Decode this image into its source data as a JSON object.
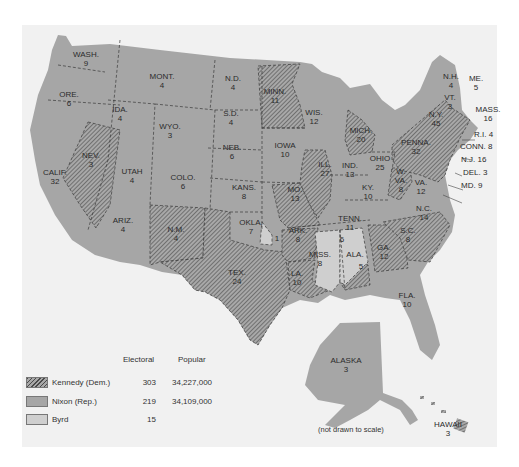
{
  "map": {
    "title": "",
    "background": "#f1f1f1",
    "colors": {
      "nixon_fill": "#a6a6a6",
      "kennedy_fill": "#a6a6a6",
      "kennedy_hatch": "#555555",
      "byrd_fill": "#cfcfcf",
      "border": "#3a3a3a"
    },
    "states": [
      {
        "abbr": "WASH.",
        "electoral": "9",
        "winner": "Nixon"
      },
      {
        "abbr": "ORE.",
        "electoral": "6",
        "winner": "Nixon"
      },
      {
        "abbr": "CALIF.",
        "electoral": "32",
        "winner": "Nixon"
      },
      {
        "abbr": "NEV.",
        "electoral": "3",
        "winner": "Kennedy"
      },
      {
        "abbr": "IDA.",
        "electoral": "4",
        "winner": "Nixon"
      },
      {
        "abbr": "MONT.",
        "electoral": "4",
        "winner": "Nixon"
      },
      {
        "abbr": "WYO.",
        "electoral": "3",
        "winner": "Nixon"
      },
      {
        "abbr": "UTAH",
        "electoral": "4",
        "winner": "Nixon"
      },
      {
        "abbr": "ARIZ.",
        "electoral": "4",
        "winner": "Nixon"
      },
      {
        "abbr": "COLO.",
        "electoral": "6",
        "winner": "Nixon"
      },
      {
        "abbr": "N.M.",
        "electoral": "4",
        "winner": "Kennedy"
      },
      {
        "abbr": "N.D.",
        "electoral": "4",
        "winner": "Nixon"
      },
      {
        "abbr": "S.D.",
        "electoral": "4",
        "winner": "Nixon"
      },
      {
        "abbr": "NEB.",
        "electoral": "6",
        "winner": "Nixon"
      },
      {
        "abbr": "KANS.",
        "electoral": "8",
        "winner": "Nixon"
      },
      {
        "abbr": "OKLA.",
        "electoral": "7",
        "winner": "Nixon",
        "byrd_electoral": "1"
      },
      {
        "abbr": "TEX.",
        "electoral": "24",
        "winner": "Kennedy"
      },
      {
        "abbr": "MINN.",
        "electoral": "11",
        "winner": "Kennedy"
      },
      {
        "abbr": "IOWA",
        "electoral": "10",
        "winner": "Nixon"
      },
      {
        "abbr": "MO.",
        "electoral": "13",
        "winner": "Kennedy"
      },
      {
        "abbr": "ARK.",
        "electoral": "8",
        "winner": "Kennedy"
      },
      {
        "abbr": "LA.",
        "electoral": "10",
        "winner": "Kennedy"
      },
      {
        "abbr": "WIS.",
        "electoral": "12",
        "winner": "Nixon"
      },
      {
        "abbr": "ILL.",
        "electoral": "27",
        "winner": "Kennedy"
      },
      {
        "abbr": "MICH.",
        "electoral": "20",
        "winner": "Kennedy"
      },
      {
        "abbr": "IND.",
        "electoral": "13",
        "winner": "Nixon"
      },
      {
        "abbr": "OHIO",
        "electoral": "25",
        "winner": "Nixon"
      },
      {
        "abbr": "KY.",
        "electoral": "10",
        "winner": "Nixon"
      },
      {
        "abbr": "TENN.",
        "electoral": "11",
        "winner": "Nixon"
      },
      {
        "abbr": "MISS.",
        "electoral": "8",
        "winner": "Byrd"
      },
      {
        "abbr": "ALA.",
        "electoral": "6",
        "winner": "Byrd",
        "kennedy_electoral": "5"
      },
      {
        "abbr": "GA.",
        "electoral": "12",
        "winner": "Kennedy"
      },
      {
        "abbr": "FLA.",
        "electoral": "10",
        "winner": "Nixon"
      },
      {
        "abbr": "S.C.",
        "electoral": "8",
        "winner": "Kennedy"
      },
      {
        "abbr": "N.C.",
        "electoral": "14",
        "winner": "Kennedy"
      },
      {
        "abbr": "VA.",
        "electoral": "12",
        "winner": "Nixon"
      },
      {
        "abbr": "W.VA.",
        "electoral": "8",
        "winner": "Kennedy"
      },
      {
        "abbr": "PENNA.",
        "electoral": "32",
        "winner": "Kennedy"
      },
      {
        "abbr": "N.Y.",
        "electoral": "45",
        "winner": "Kennedy"
      },
      {
        "abbr": "VT.",
        "electoral": "3",
        "winner": "Nixon"
      },
      {
        "abbr": "N.H.",
        "electoral": "4",
        "winner": "Nixon"
      },
      {
        "abbr": "ME.",
        "electoral": "5",
        "winner": "Nixon"
      },
      {
        "abbr": "MASS.",
        "electoral": "16",
        "winner": "Kennedy"
      },
      {
        "abbr": "R.I.",
        "electoral": "4",
        "winner": "Kennedy"
      },
      {
        "abbr": "CONN.",
        "electoral": "8",
        "winner": "Kennedy"
      },
      {
        "abbr": "N.J.",
        "electoral": "16",
        "winner": "Kennedy"
      },
      {
        "abbr": "DEL.",
        "electoral": "3",
        "winner": "Kennedy"
      },
      {
        "abbr": "MD.",
        "electoral": "9",
        "winner": "Kennedy"
      },
      {
        "abbr": "ALASKA",
        "electoral": "3",
        "winner": "Nixon"
      },
      {
        "abbr": "HAWAII",
        "electoral": "3",
        "winner": "Kennedy"
      }
    ],
    "labels": {
      "wash": "WASH.",
      "wash_n": "9",
      "ore": "ORE.",
      "ore_n": "6",
      "calif": "CALIF.",
      "calif_n": "32",
      "nev": "NEV.",
      "nev_n": "3",
      "ida": "IDA.",
      "ida_n": "4",
      "mont": "MONT.",
      "mont_n": "4",
      "wyo": "WYO.",
      "wyo_n": "3",
      "utah": "UTAH",
      "utah_n": "4",
      "ariz": "ARIZ.",
      "ariz_n": "4",
      "colo": "COLO.",
      "colo_n": "6",
      "nm": "N.M.",
      "nm_n": "4",
      "nd": "N.D.",
      "nd_n": "4",
      "sd": "S.D.",
      "sd_n": "4",
      "neb": "NEB.",
      "neb_n": "6",
      "kans": "KANS.",
      "kans_n": "8",
      "okla": "OKLA.",
      "okla_n": "7",
      "okla_byrd": "1",
      "tex": "TEX.",
      "tex_n": "24",
      "minn": "MINN.",
      "minn_n": "11",
      "iowa": "IOWA",
      "iowa_n": "10",
      "mo": "MO.",
      "mo_n": "13",
      "ark": "ARK.",
      "ark_n": "8",
      "la": "LA.",
      "la_n": "10",
      "wis": "WIS.",
      "wis_n": "12",
      "ill": "ILL.",
      "ill_n": "27",
      "mich": "MICH.",
      "mich_n": "20",
      "ind": "IND.",
      "ind_n": "13",
      "ohio": "OHIO",
      "ohio_n": "25",
      "ky": "KY.",
      "ky_n": "10",
      "tenn": "TENN.",
      "tenn_n": "11",
      "miss": "MISS.",
      "miss_n": "8",
      "ala": "ALA.",
      "ala_n": "6",
      "ala_k": "5",
      "ga": "GA.",
      "ga_n": "12",
      "fla": "FLA.",
      "fla_n": "10",
      "sc": "S.C.",
      "sc_n": "8",
      "nc": "N.C.",
      "nc_n": "14",
      "va": "VA.",
      "va_n": "12",
      "wva1": "W.",
      "wva2": "VA.",
      "wva_n": "8",
      "penna": "PENNA.",
      "penna_n": "32",
      "ny": "N.Y.",
      "ny_n": "45",
      "vt": "VT.",
      "vt_n": "3",
      "nh": "N.H.",
      "nh_n": "4",
      "me": "ME.",
      "me_n": "5",
      "mass": "MASS.",
      "mass_n": "16",
      "ri": "R.I. 4",
      "conn": "CONN. 8",
      "nj": "N.J. 16",
      "del": "DEL. 3",
      "md": "MD. 9",
      "alaska": "ALASKA",
      "alaska_n": "3",
      "hawaii": "HAWAII",
      "hawaii_n": "3"
    },
    "note": "(not drawn to scale)"
  },
  "legend": {
    "headers": {
      "electoral": "Electoral",
      "popular": "Popular"
    },
    "rows": [
      {
        "name": "Kennedy (Dem.)",
        "electoral": "303",
        "popular": "34,227,000",
        "swatch": "hatched"
      },
      {
        "name": "Nixon (Rep.)",
        "electoral": "219",
        "popular": "34,109,000",
        "swatch": "#a6a6a6"
      },
      {
        "name": "Byrd",
        "electoral": "15",
        "popular": "",
        "swatch": "#cfcfcf"
      }
    ]
  }
}
